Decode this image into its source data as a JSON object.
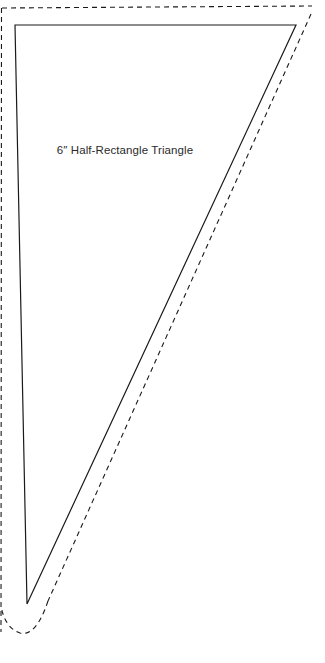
{
  "document": {
    "type": "quilting-pattern-template",
    "background_color": "#ffffff",
    "width": 325,
    "height": 663
  },
  "piece": {
    "label": "6″ Half-Rectangle Triangle",
    "label_color": "#2b2b2b",
    "cut_line_color": "#1a1a1a",
    "seam_line_color": "#1a1a1a",
    "cut_line_style": "solid",
    "seam_line_style": "dashed"
  },
  "geometry": {
    "solid_triangle_points": "15,25 296,25 27,604",
    "dashed_outline_path": "M 1,663 L 1,206 L 1.5,90 L 2,8 L 312,6 L 310,20 L 55,604 Q 40,640 20,633 Q 2,626 1,600 L 1,663",
    "dashed_top_edge": "M 2,8 L 312,6",
    "dashed_left_edge": "M 1.5,8 L 1,632",
    "dashed_hypotenuse": "M 311,14 L 48,601",
    "dashed_bottom_curve": "M 48,601 Q 36,637 20,633 Q 5,628 1,606"
  },
  "labels": {
    "size": "6″",
    "name": "Half-Rectangle Triangle"
  }
}
